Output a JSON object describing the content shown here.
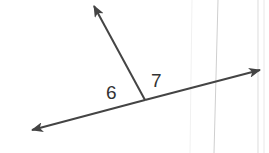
{
  "diagram": {
    "type": "angle-pair",
    "labels": {
      "angle_left": "6",
      "angle_right": "7"
    },
    "colors": {
      "stroke": "#444444",
      "label": "#333333",
      "page_lines": "#d8d8d8"
    }
  }
}
